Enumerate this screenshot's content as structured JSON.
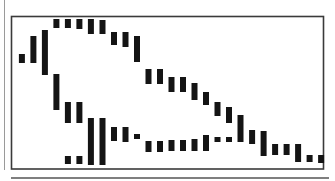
{
  "chart_data": {
    "type": "bar",
    "subtype": "range",
    "title": "",
    "xlabel": "",
    "ylabel": "",
    "grid": false,
    "legend": "none",
    "x_count": 27,
    "xlim": [
      -0.6,
      26.6
    ],
    "ylim": [
      0,
      153
    ],
    "bar_color": "#141414",
    "frame_color": "#3a3a3a",
    "series": [
      {
        "name": "upper",
        "bars": [
          {
            "x": 0,
            "low": 106,
            "high": 115
          },
          {
            "x": 1,
            "low": 106,
            "high": 133
          },
          {
            "x": 2,
            "low": 94,
            "high": 139
          },
          {
            "x": 3,
            "low": 141,
            "high": 150
          },
          {
            "x": 4,
            "low": 141,
            "high": 150
          },
          {
            "x": 5,
            "low": 140,
            "high": 150
          },
          {
            "x": 6,
            "low": 135,
            "high": 150
          },
          {
            "x": 7,
            "low": 135,
            "high": 149
          },
          {
            "x": 8,
            "low": 124,
            "high": 137
          },
          {
            "x": 9,
            "low": 122,
            "high": 137
          },
          {
            "x": 10,
            "low": 107,
            "high": 133
          },
          {
            "x": 11,
            "low": 85,
            "high": 100
          },
          {
            "x": 12,
            "low": 85,
            "high": 100
          },
          {
            "x": 13,
            "low": 77,
            "high": 92
          },
          {
            "x": 14,
            "low": 77,
            "high": 92
          },
          {
            "x": 15,
            "low": 69,
            "high": 86
          },
          {
            "x": 16,
            "low": 64,
            "high": 77
          },
          {
            "x": 17,
            "low": 53,
            "high": 67
          },
          {
            "x": 18,
            "low": 46,
            "high": 62
          },
          {
            "x": 19,
            "low": 27,
            "high": 54
          },
          {
            "x": 20,
            "low": 25,
            "high": 39
          },
          {
            "x": 21,
            "low": 13,
            "high": 38
          },
          {
            "x": 22,
            "low": 14,
            "high": 25
          },
          {
            "x": 23,
            "low": 14,
            "high": 25
          },
          {
            "x": 24,
            "low": 7,
            "high": 25
          },
          {
            "x": 25,
            "low": 7,
            "high": 14
          },
          {
            "x": 26,
            "low": 6,
            "high": 14
          }
        ]
      },
      {
        "name": "lower",
        "bars": [
          {
            "x": 3,
            "low": 59,
            "high": 95
          },
          {
            "x": 4,
            "low": 46,
            "high": 67
          },
          {
            "x": 4,
            "low": 5,
            "high": 13
          },
          {
            "x": 5,
            "low": 46,
            "high": 67
          },
          {
            "x": 5,
            "low": 5,
            "high": 13
          },
          {
            "x": 6,
            "low": 4,
            "high": 51
          },
          {
            "x": 7,
            "low": 4,
            "high": 51
          },
          {
            "x": 8,
            "low": 28,
            "high": 42
          },
          {
            "x": 9,
            "low": 27,
            "high": 42
          },
          {
            "x": 10,
            "low": 30,
            "high": 35
          },
          {
            "x": 11,
            "low": 17,
            "high": 28
          },
          {
            "x": 12,
            "low": 17,
            "high": 28
          },
          {
            "x": 13,
            "low": 18,
            "high": 29
          },
          {
            "x": 14,
            "low": 18,
            "high": 29
          },
          {
            "x": 15,
            "low": 18,
            "high": 30
          },
          {
            "x": 16,
            "low": 18,
            "high": 34
          },
          {
            "x": 17,
            "low": 27,
            "high": 32
          },
          {
            "x": 18,
            "low": 27,
            "high": 32
          }
        ]
      }
    ]
  }
}
